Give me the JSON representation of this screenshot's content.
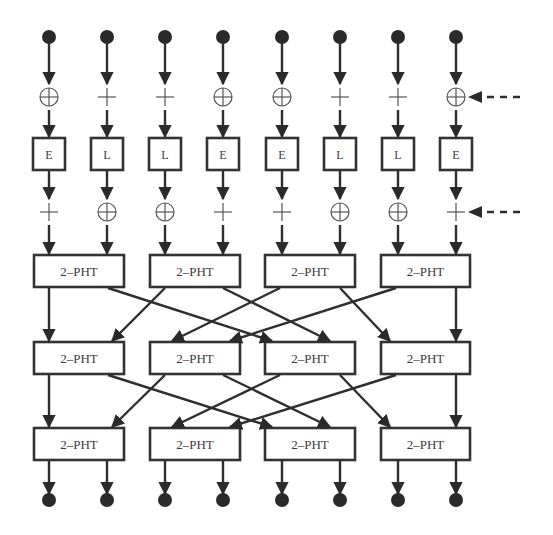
{
  "diagram": {
    "columns_x": [
      49,
      107,
      165,
      223,
      282,
      340,
      398,
      456
    ],
    "inputs": {
      "count": 8,
      "symbol": "filled-circle"
    },
    "first_mix_layer": {
      "ops": [
        "xor",
        "add",
        "add",
        "xor",
        "xor",
        "add",
        "add",
        "xor"
      ],
      "key_input_arrow": "dashed-arrow-from-right"
    },
    "nonlinear_layer": {
      "labels": [
        "E",
        "L",
        "L",
        "E",
        "E",
        "L",
        "L",
        "E"
      ]
    },
    "second_mix_layer": {
      "ops": [
        "add",
        "xor",
        "xor",
        "add",
        "add",
        "xor",
        "xor",
        "add"
      ],
      "key_input_arrow": "dashed-arrow-from-right"
    },
    "pht_layers": [
      {
        "boxes": [
          "2–PHT",
          "2–PHT",
          "2–PHT",
          "2–PHT"
        ]
      },
      {
        "boxes": [
          "2–PHT",
          "2–PHT",
          "2–PHT",
          "2–PHT"
        ]
      },
      {
        "boxes": [
          "2–PHT",
          "2–PHT",
          "2–PHT",
          "2–PHT"
        ]
      }
    ],
    "pht_interconnect": [
      {
        "from": "A.left",
        "to": "A.left"
      },
      {
        "from": "A.right",
        "to": "C.left"
      },
      {
        "from": "B.left",
        "to": "A.right"
      },
      {
        "from": "B.right",
        "to": "C.right"
      },
      {
        "from": "C.left",
        "to": "B.left"
      },
      {
        "from": "C.right",
        "to": "D.left"
      },
      {
        "from": "D.left",
        "to": "B.right"
      },
      {
        "from": "D.right",
        "to": "D.right"
      }
    ],
    "outputs": {
      "count": 8,
      "symbol": "filled-circle"
    }
  }
}
